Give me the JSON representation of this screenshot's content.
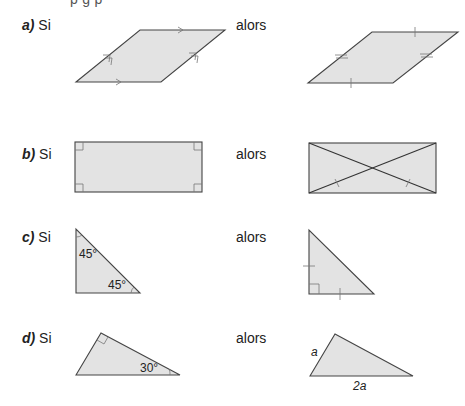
{
  "header": {
    "cutoff_text": "p    g  p"
  },
  "rows": [
    {
      "letter": "a)",
      "si": "Si",
      "alors": "alors",
      "hypothesis": "parallelogram-with-parallel-sides",
      "conclusion": "opposite-sides-equal"
    },
    {
      "letter": "b)",
      "si": "Si",
      "alors": "alors",
      "hypothesis": "rectangle-four-right-angles",
      "conclusion": "diagonals-equal-and-bisect"
    },
    {
      "letter": "c)",
      "si": "Si",
      "alors": "alors",
      "hypothesis": "right-triangle-two-45-angles",
      "conclusion": "isosceles-right-triangle",
      "angle_labels": [
        "45°",
        "45°"
      ]
    },
    {
      "letter": "d)",
      "si": "Si",
      "alors": "alors",
      "hypothesis": "right-triangle-30-angle",
      "conclusion": "short-leg-half-hypotenuse",
      "angle_labels": [
        "30°"
      ],
      "side_labels": [
        "a",
        "2a"
      ]
    }
  ],
  "colors": {
    "fill": "#e3e3e3",
    "stroke": "#444444",
    "marks": "#777777"
  }
}
